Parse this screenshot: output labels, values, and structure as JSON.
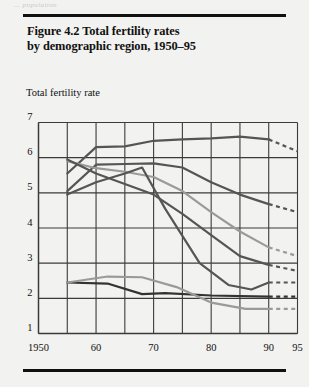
{
  "running_head": "... population",
  "figure": {
    "title_line1": "Figure 4.2  Total fertility rates",
    "title_line2": "by demographic region, 1950–95",
    "axis_caption": "Total fertility rate"
  },
  "colors": {
    "background": "#f2f2f0",
    "rule": "#111111",
    "grid": "#3b3b3b",
    "dark_line": "#555555",
    "light_line": "#9a9a9a",
    "text": "#111111"
  },
  "chart_data": {
    "type": "line",
    "title": "Figure 4.2  Total fertility rates by demographic region, 1950–95",
    "xlabel": "",
    "ylabel": "Total fertility rate",
    "xlim": [
      1950,
      1995
    ],
    "ylim": [
      1,
      7
    ],
    "grid": true,
    "legend": "none",
    "x_tick_labels": [
      "1950",
      "60",
      "70",
      "80",
      "90",
      "95"
    ],
    "x_tick_values": [
      1950,
      1960,
      1970,
      1980,
      1990,
      1995
    ],
    "x_minor_ticks": [
      1955,
      1965,
      1975,
      1985
    ],
    "y_tick_labels": [
      "1",
      "2",
      "3",
      "4",
      "5",
      "6",
      "7"
    ],
    "y_tick_values": [
      1,
      2,
      3,
      4,
      5,
      6,
      7
    ],
    "projection_note": "dashed segments 1990–1995 are projections",
    "series": [
      {
        "name": "high-fertility-region",
        "color": "#555555",
        "x": [
          1955,
          1960,
          1965,
          1970,
          1975,
          1980,
          1985,
          1990
        ],
        "values": [
          5.55,
          6.3,
          6.32,
          6.48,
          6.52,
          6.55,
          6.6,
          6.52
        ],
        "projection_x": [
          1990,
          1995
        ],
        "projection_values": [
          6.52,
          6.18
        ]
      },
      {
        "name": "second-high-region",
        "color": "#555555",
        "x": [
          1955,
          1960,
          1965,
          1970,
          1975,
          1980,
          1985,
          1990
        ],
        "values": [
          5.05,
          5.8,
          5.82,
          5.84,
          5.72,
          5.3,
          4.95,
          4.68
        ],
        "projection_x": [
          1990,
          1995
        ],
        "projection_values": [
          4.68,
          4.45
        ]
      },
      {
        "name": "mid-declining-region-light",
        "color": "#9a9a9a",
        "x": [
          1955,
          1960,
          1965,
          1970,
          1975,
          1980,
          1985,
          1990
        ],
        "values": [
          5.9,
          5.7,
          5.6,
          5.45,
          5.05,
          4.45,
          3.9,
          3.45
        ],
        "projection_x": [
          1990,
          1995
        ],
        "projection_values": [
          3.45,
          3.2
        ]
      },
      {
        "name": "mid-declining-region-dark",
        "color": "#555555",
        "x": [
          1955,
          1960,
          1965,
          1970,
          1975,
          1980,
          1985,
          1990
        ],
        "values": [
          5.95,
          5.55,
          5.25,
          4.95,
          4.4,
          3.8,
          3.2,
          2.95
        ],
        "projection_x": [
          1990,
          1995
        ],
        "projection_values": [
          2.95,
          2.78
        ]
      },
      {
        "name": "east-asia-steep-decline",
        "color": "#555555",
        "x": [
          1955,
          1960,
          1965,
          1968,
          1972,
          1978,
          1983,
          1987,
          1990
        ],
        "values": [
          4.95,
          5.3,
          5.55,
          5.72,
          4.55,
          3.0,
          2.38,
          2.25,
          2.45
        ],
        "projection_x": [
          1990,
          1995
        ],
        "projection_values": [
          2.45,
          2.45
        ]
      },
      {
        "name": "industrial-region-dark",
        "color": "#333333",
        "x": [
          1955,
          1962,
          1968,
          1972,
          1980,
          1990
        ],
        "values": [
          2.45,
          2.42,
          2.12,
          2.15,
          2.08,
          2.05
        ],
        "projection_x": [
          1990,
          1995
        ],
        "projection_values": [
          2.05,
          2.05
        ]
      },
      {
        "name": "industrial-region-light",
        "color": "#9a9a9a",
        "x": [
          1955,
          1962,
          1968,
          1974,
          1980,
          1986,
          1990
        ],
        "values": [
          2.45,
          2.62,
          2.6,
          2.32,
          1.88,
          1.7,
          1.7
        ],
        "projection_x": [
          1990,
          1995
        ],
        "projection_values": [
          1.7,
          1.7
        ]
      }
    ]
  }
}
